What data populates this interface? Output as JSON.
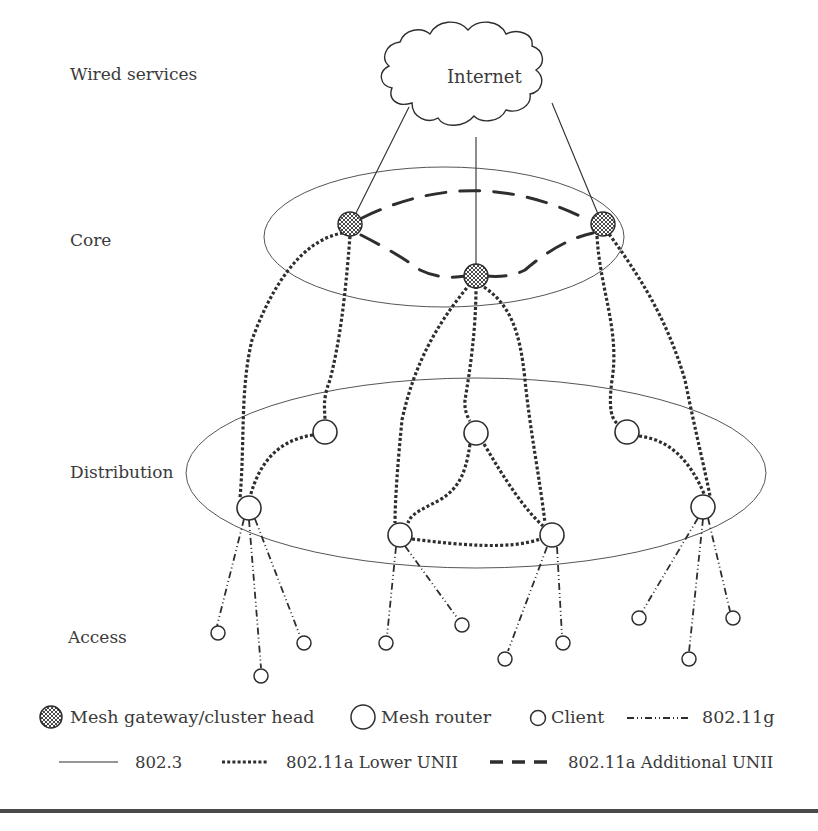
{
  "diagram": {
    "tiers": [
      {
        "id": "wired",
        "label": "Wired services"
      },
      {
        "id": "core",
        "label": "Core"
      },
      {
        "id": "distribution",
        "label": "Distribution"
      },
      {
        "id": "access",
        "label": "Access"
      }
    ],
    "cloud": {
      "label": "Internet"
    },
    "node_types": {
      "gateway": "Mesh gateway/cluster head",
      "router": "Mesh router",
      "client": "Client"
    },
    "gateways": [
      {
        "id": "G1",
        "x": 252,
        "y": 224
      },
      {
        "id": "G2",
        "x": 476,
        "y": 276
      },
      {
        "id": "G3",
        "x": 603,
        "y": 224
      }
    ],
    "routers": [
      {
        "id": "R1",
        "x": 325,
        "y": 432
      },
      {
        "id": "R2",
        "x": 476,
        "y": 433
      },
      {
        "id": "R3",
        "x": 627,
        "y": 432
      },
      {
        "id": "R4",
        "x": 249,
        "y": 508
      },
      {
        "id": "R5",
        "x": 400,
        "y": 535
      },
      {
        "id": "R6",
        "x": 552,
        "y": 535
      },
      {
        "id": "R7",
        "x": 703,
        "y": 507
      }
    ],
    "clients": [
      {
        "id": "C1",
        "x": 215,
        "y": 633,
        "parent": "R4"
      },
      {
        "id": "C2",
        "x": 262,
        "y": 676,
        "parent": "R4"
      },
      {
        "id": "C3",
        "x": 303,
        "y": 643,
        "parent": "R4"
      },
      {
        "id": "C4",
        "x": 387,
        "y": 643,
        "parent": "R5"
      },
      {
        "id": "C5",
        "x": 462,
        "y": 625,
        "parent": "R5"
      },
      {
        "id": "C6",
        "x": 505,
        "y": 659,
        "parent": "R6"
      },
      {
        "id": "C7",
        "x": 563,
        "y": 643,
        "parent": "R6"
      },
      {
        "id": "C8",
        "x": 639,
        "y": 618,
        "parent": "R7"
      },
      {
        "id": "C9",
        "x": 689,
        "y": 659,
        "parent": "R7"
      },
      {
        "id": "C10",
        "x": 733,
        "y": 618,
        "parent": "R7"
      }
    ],
    "links_802_3": [
      {
        "from": "Internet",
        "to": "G1"
      },
      {
        "from": "Internet",
        "to": "G2"
      },
      {
        "from": "Internet",
        "to": "G3"
      }
    ],
    "links_802_11a_additional": [
      {
        "from": "G1",
        "to": "G3"
      },
      {
        "from": "G1",
        "to": "G2"
      },
      {
        "from": "G2",
        "to": "G3"
      }
    ],
    "links_802_11a_lower": [
      {
        "from": "G1",
        "to": "R4"
      },
      {
        "from": "G1",
        "to": "R1"
      },
      {
        "from": "R1",
        "to": "R4"
      },
      {
        "from": "G2",
        "to": "R5"
      },
      {
        "from": "G2",
        "to": "R2"
      },
      {
        "from": "G2",
        "to": "R6"
      },
      {
        "from": "R2",
        "to": "R5"
      },
      {
        "from": "R2",
        "to": "R6"
      },
      {
        "from": "R5",
        "to": "R6"
      },
      {
        "from": "G3",
        "to": "R3"
      },
      {
        "from": "G3",
        "to": "R7"
      },
      {
        "from": "R3",
        "to": "R7"
      }
    ],
    "links_802_11g": "router-to-client access links"
  },
  "legend": {
    "row1": [
      {
        "icon": "gateway",
        "label": "Mesh gateway/cluster head"
      },
      {
        "icon": "router",
        "label": "Mesh router"
      },
      {
        "icon": "client",
        "label": "Client"
      },
      {
        "icon": "line-dash-dot-dot",
        "label": "802.11g"
      }
    ],
    "row2": [
      {
        "icon": "line-solid",
        "label": "802.3"
      },
      {
        "icon": "line-dotted-heavy",
        "label": "802.11a Lower UNII"
      },
      {
        "icon": "line-long-dash",
        "label": "802.11a Additional UNII"
      }
    ]
  },
  "colors": {
    "ink": "#2e2e2e",
    "text": "#3a3a3a",
    "rule": "#4a4a4a",
    "background": "#ffffff"
  }
}
